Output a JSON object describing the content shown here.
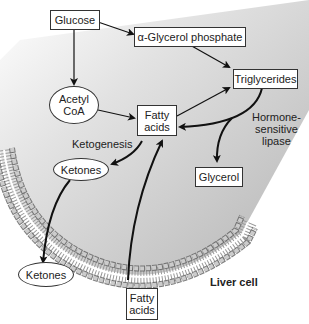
{
  "diagram": {
    "title": "Liver cell",
    "nodes": {
      "glucose": "Glucose",
      "glycerol_phosphate": "α-Glycerol phosphate",
      "triglycerides": "Triglycerides",
      "acetyl_coa_line1": "Acetyl",
      "acetyl_coa_line2": "CoA",
      "fatty_acids_inner_line1": "Fatty",
      "fatty_acids_inner_line2": "acids",
      "ketones_inner": "Ketones",
      "glycerol": "Glycerol",
      "ketones_outer": "Ketones",
      "fatty_acids_outer_line1": "Fatty",
      "fatty_acids_outer_line2": "acids"
    },
    "labels": {
      "ketogenesis": "Ketogenesis",
      "hsl_line1": "Hormone-",
      "hsl_line2": "sensitive",
      "hsl_line3": "lipase",
      "cell": "Liver cell"
    },
    "edges": [
      {
        "from": "Glucose",
        "to": "α-Glycerol phosphate"
      },
      {
        "from": "Glucose",
        "to": "Acetyl CoA"
      },
      {
        "from": "α-Glycerol phosphate",
        "to": "Triglycerides"
      },
      {
        "from": "Acetyl CoA",
        "to": "Fatty acids"
      },
      {
        "from": "Fatty acids",
        "to": "Triglycerides"
      },
      {
        "from": "Triglycerides",
        "to": "Fatty acids",
        "label": "Hormone-sensitive lipase"
      },
      {
        "from": "Triglycerides",
        "to": "Glycerol"
      },
      {
        "from": "Fatty acids",
        "to": "Ketones",
        "label": "Ketogenesis"
      },
      {
        "from": "Ketones (inside)",
        "to": "Ketones (outside)"
      },
      {
        "from": "Fatty acids (outside)",
        "to": "Fatty acids (inside)"
      }
    ],
    "colors": {
      "cell_fill": "#bdbdbd",
      "line": "#111111",
      "box_border": "#333333"
    }
  }
}
